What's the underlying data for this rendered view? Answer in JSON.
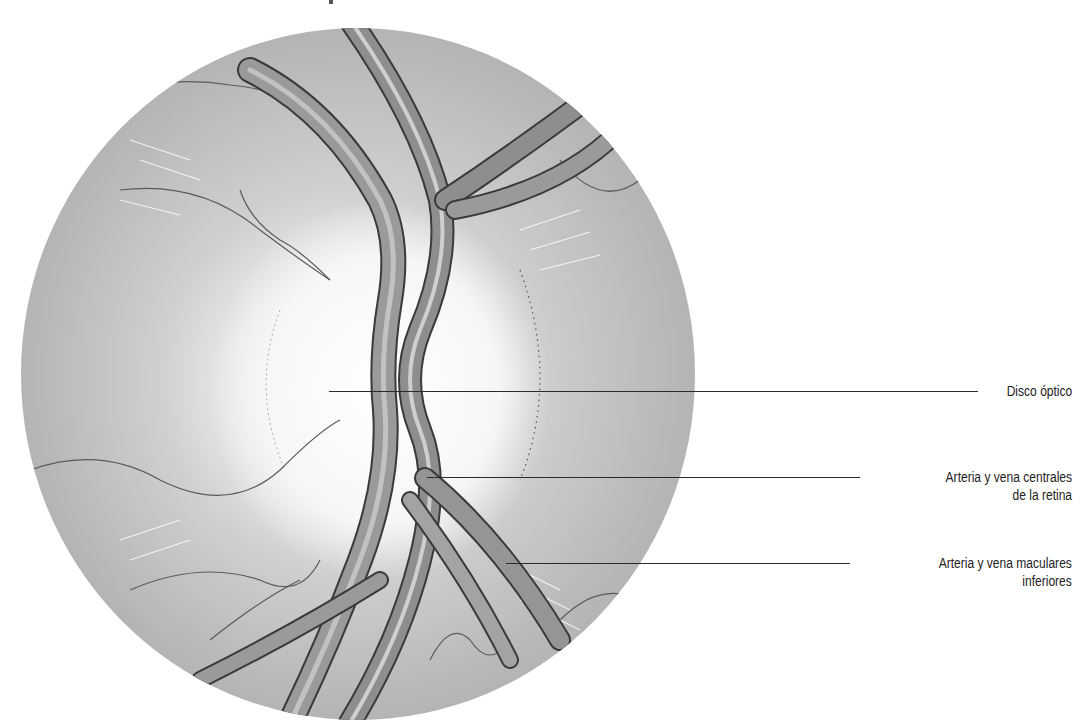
{
  "figure": {
    "background": "#ffffff",
    "fundus_color": "#b9b9b9",
    "disc_color": "#f4f4f4",
    "vessel_color": "#8a8a8a",
    "vessel_edge_color": "#3a3a3a"
  },
  "labels": [
    {
      "id": "optic-disc",
      "lines": [
        "Disco óptico"
      ]
    },
    {
      "id": "central-retinal-vessels",
      "lines": [
        "Arteria y vena centrales",
        "de la retina"
      ]
    },
    {
      "id": "inferior-macular-vessels",
      "lines": [
        "Arteria y vena maculares",
        "inferiores"
      ]
    }
  ]
}
